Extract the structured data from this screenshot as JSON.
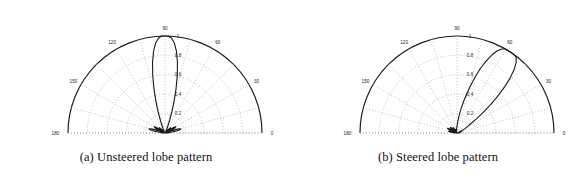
{
  "figure": {
    "panels": [
      {
        "id": "panel-a",
        "caption": "(a) Unsteered lobe pattern",
        "chart_ref": 0
      },
      {
        "id": "panel-b",
        "caption": "(b) Steered lobe pattern",
        "chart_ref": 1
      }
    ]
  },
  "chart_data": [
    {
      "type": "line",
      "projection": "polar",
      "title": "(a) Unsteered lobe pattern",
      "xlabel": "",
      "ylabel": "",
      "grid": true,
      "legend": null,
      "theta_unit": "degrees",
      "theta_range": [
        0,
        180
      ],
      "theta_tick_labels": [
        "0",
        "30",
        "60",
        "90",
        "120",
        "150",
        "180"
      ],
      "theta_ticks": [
        0,
        30,
        60,
        90,
        120,
        150,
        180
      ],
      "r_range": [
        0,
        1
      ],
      "r_tick_labels": [
        "0.2",
        "0.4",
        "0.6",
        "0.8",
        "1"
      ],
      "r_ticks": [
        0.2,
        0.4,
        0.6,
        0.8,
        1.0
      ],
      "main_lobe_peak_deg": 90,
      "main_lobe_peak_value": 1.0,
      "series": [
        {
          "name": "array factor magnitude",
          "color": "#1a1a1a",
          "theta": [
            0,
            2,
            4,
            6,
            8,
            10,
            12,
            14,
            16,
            18,
            20,
            22,
            24,
            26,
            28,
            30,
            32,
            34,
            36,
            38,
            40,
            42,
            44,
            46,
            48,
            50,
            52,
            54,
            56,
            58,
            60,
            62,
            64,
            66,
            68,
            70,
            72,
            74,
            76,
            78,
            80,
            82,
            84,
            86,
            88,
            90,
            92,
            94,
            96,
            98,
            100,
            102,
            104,
            106,
            108,
            110,
            112,
            114,
            116,
            118,
            120,
            122,
            124,
            126,
            128,
            130,
            132,
            134,
            136,
            138,
            140,
            142,
            144,
            146,
            148,
            150,
            152,
            154,
            156,
            158,
            160,
            162,
            164,
            166,
            168,
            170,
            172,
            174,
            176,
            178,
            180
          ],
          "r": [
            0.0,
            0.01,
            0.02,
            0.04,
            0.07,
            0.11,
            0.15,
            0.17,
            0.16,
            0.12,
            0.06,
            0.01,
            0.04,
            0.09,
            0.12,
            0.13,
            0.11,
            0.07,
            0.02,
            0.02,
            0.06,
            0.08,
            0.08,
            0.06,
            0.03,
            0.01,
            0.02,
            0.04,
            0.04,
            0.03,
            0.02,
            0.01,
            0.02,
            0.04,
            0.08,
            0.14,
            0.23,
            0.34,
            0.47,
            0.61,
            0.74,
            0.85,
            0.93,
            0.98,
            1.0,
            1.0,
            1.0,
            0.98,
            0.93,
            0.85,
            0.74,
            0.61,
            0.47,
            0.34,
            0.23,
            0.14,
            0.08,
            0.04,
            0.02,
            0.01,
            0.02,
            0.03,
            0.04,
            0.04,
            0.02,
            0.01,
            0.03,
            0.06,
            0.08,
            0.08,
            0.06,
            0.02,
            0.02,
            0.07,
            0.11,
            0.13,
            0.12,
            0.09,
            0.04,
            0.01,
            0.06,
            0.12,
            0.16,
            0.17,
            0.15,
            0.11,
            0.07,
            0.04,
            0.02,
            0.01,
            0.0
          ]
        }
      ]
    },
    {
      "type": "line",
      "projection": "polar",
      "title": "(b) Steered lobe pattern",
      "xlabel": "",
      "ylabel": "",
      "grid": true,
      "legend": null,
      "theta_unit": "degrees",
      "theta_range": [
        0,
        180
      ],
      "theta_tick_labels": [
        "0",
        "30",
        "60",
        "90",
        "120",
        "150",
        "180"
      ],
      "theta_ticks": [
        0,
        30,
        60,
        90,
        120,
        150,
        180
      ],
      "r_range": [
        0,
        1
      ],
      "r_tick_labels": [
        "0.2",
        "0.4",
        "0.6",
        "0.8",
        "1"
      ],
      "r_ticks": [
        0.2,
        0.4,
        0.6,
        0.8,
        1.0
      ],
      "main_lobe_peak_deg": 60,
      "main_lobe_peak_value": 1.0,
      "series": [
        {
          "name": "array factor magnitude",
          "color": "#1a1a1a",
          "theta": [
            0,
            2,
            4,
            6,
            8,
            10,
            12,
            14,
            16,
            18,
            20,
            22,
            24,
            26,
            28,
            30,
            32,
            34,
            36,
            38,
            40,
            42,
            44,
            46,
            48,
            50,
            52,
            54,
            56,
            58,
            60,
            62,
            64,
            66,
            68,
            70,
            72,
            74,
            76,
            78,
            80,
            82,
            84,
            86,
            88,
            90,
            92,
            94,
            96,
            98,
            100,
            102,
            104,
            106,
            108,
            110,
            112,
            114,
            116,
            118,
            120,
            122,
            124,
            126,
            128,
            130,
            132,
            134,
            136,
            138,
            140,
            142,
            144,
            146,
            148,
            150,
            152,
            154,
            156,
            158,
            160,
            162,
            164,
            166,
            168,
            170,
            172,
            174,
            176,
            178,
            180
          ],
          "r": [
            0.0,
            0.01,
            0.02,
            0.03,
            0.03,
            0.02,
            0.01,
            0.02,
            0.04,
            0.05,
            0.04,
            0.02,
            0.02,
            0.06,
            0.09,
            0.11,
            0.13,
            0.17,
            0.24,
            0.33,
            0.44,
            0.56,
            0.68,
            0.79,
            0.88,
            0.95,
            0.99,
            1.0,
            1.0,
            1.0,
            1.0,
            0.98,
            0.94,
            0.88,
            0.8,
            0.71,
            0.61,
            0.51,
            0.42,
            0.34,
            0.27,
            0.21,
            0.16,
            0.12,
            0.09,
            0.07,
            0.06,
            0.05,
            0.04,
            0.03,
            0.02,
            0.01,
            0.01,
            0.02,
            0.03,
            0.04,
            0.04,
            0.03,
            0.02,
            0.01,
            0.02,
            0.04,
            0.06,
            0.07,
            0.06,
            0.04,
            0.02,
            0.02,
            0.05,
            0.08,
            0.09,
            0.08,
            0.05,
            0.02,
            0.03,
            0.07,
            0.1,
            0.11,
            0.09,
            0.06,
            0.03,
            0.02,
            0.05,
            0.08,
            0.09,
            0.08,
            0.06,
            0.04,
            0.02,
            0.01,
            0.0
          ]
        }
      ]
    }
  ]
}
